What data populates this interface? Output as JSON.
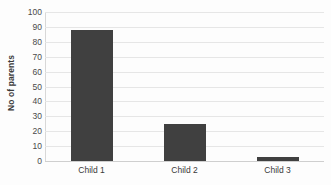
{
  "chart_data": {
    "type": "bar",
    "title": "",
    "xlabel": "",
    "ylabel": "No of parents",
    "categories": [
      "Child 1",
      "Child 2",
      "Child 3"
    ],
    "values": [
      88,
      25,
      3
    ],
    "ylim": [
      0,
      100
    ],
    "ytick_step": 10,
    "yticks": [
      100,
      90,
      80,
      70,
      60,
      50,
      40,
      30,
      20,
      10,
      0
    ],
    "ytick_labels": [
      "100",
      "90",
      "80",
      "70",
      "60",
      "50",
      "40",
      "30",
      "20",
      "10",
      "0"
    ],
    "grid": true,
    "grid_axis": "y",
    "legend": false,
    "legend_position": "none",
    "series": [
      {
        "name": "No of parents",
        "values": [
          88,
          25,
          3
        ]
      }
    ],
    "colors": {
      "bar_fill": "#404040",
      "gridline": "#e6e6e6",
      "baseline": "#cfcfcf",
      "axis_line": "#d8d8d8",
      "background": "#fdfdfd",
      "tick_text": "#4a4a4a",
      "label_text": "#3a3a3a"
    }
  }
}
